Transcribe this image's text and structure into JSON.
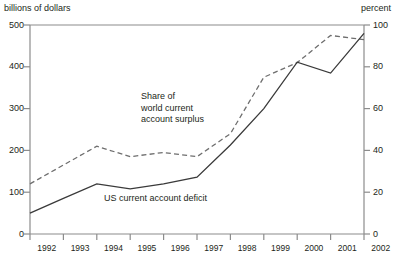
{
  "chart_data": {
    "type": "line",
    "title": "",
    "xlabel": "",
    "ylabel": "billions of dollars",
    "y2label": "percent",
    "x": [
      1992,
      1993,
      1994,
      1995,
      1996,
      1997,
      1998,
      1999,
      2000,
      2001,
      2002
    ],
    "xticklabels": [
      "1992",
      "1993",
      "1994",
      "1995",
      "1996",
      "1997",
      "1998",
      "1999",
      "2000",
      "2001",
      "2002"
    ],
    "ylim": [
      0,
      500
    ],
    "yticks": [
      0,
      100,
      200,
      300,
      400,
      500
    ],
    "yticklabels": [
      "0",
      "100",
      "200",
      "300",
      "400",
      "500"
    ],
    "y2lim": [
      0,
      100
    ],
    "y2ticks": [
      0,
      20,
      40,
      60,
      80,
      100
    ],
    "y2ticklabels": [
      "0",
      "20",
      "40",
      "60",
      "80",
      "100"
    ],
    "grid": false,
    "legend_position": "inline-annotations",
    "series": [
      {
        "name": "US current account deficit",
        "style": "solid",
        "color": "#3a3a3a",
        "axis": "left",
        "unit": "billions of dollars",
        "values": [
          50,
          85,
          120,
          108,
          120,
          136,
          213,
          300,
          411,
          385,
          480
        ]
      },
      {
        "name": "Share of world current account surplus",
        "style": "dashed",
        "color": "#6e6e6e",
        "axis": "right",
        "unit": "percent",
        "values": [
          24,
          33,
          42,
          37,
          39,
          37,
          48,
          75,
          82,
          95,
          93
        ]
      }
    ],
    "annotations": [
      {
        "text": "Share of\nworld current\naccount surplus",
        "line1": "Share of",
        "line2": "world current",
        "line3": "account surplus"
      },
      {
        "text": "US current account deficit"
      }
    ]
  },
  "labels": {
    "left_axis_title": "billions of dollars",
    "right_axis_title": "percent",
    "annotation_share_line1": "Share of",
    "annotation_share_line2": "world current",
    "annotation_share_line3": "account surplus",
    "annotation_deficit": "US current account deficit"
  }
}
